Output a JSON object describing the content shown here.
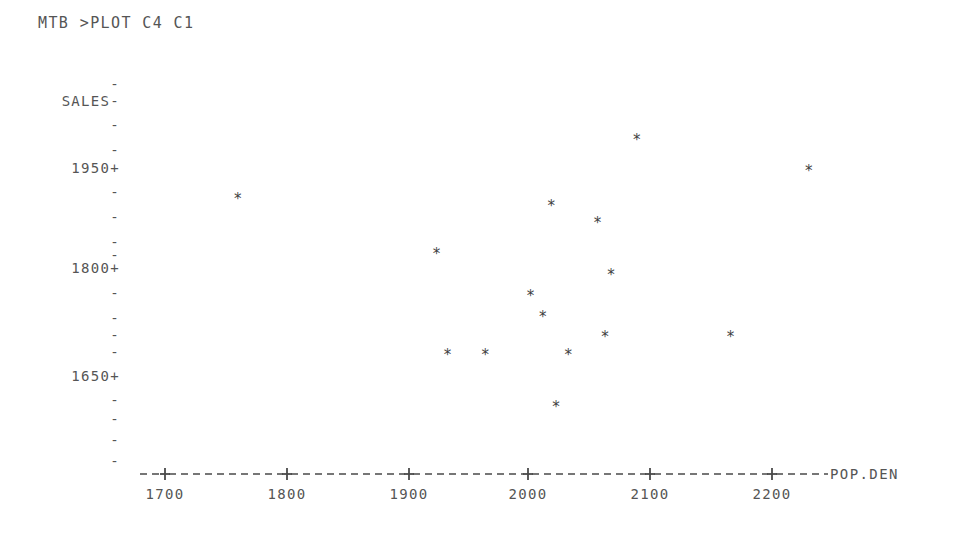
{
  "terminal": {
    "command_line": "MTB >PLOT C4 C1"
  },
  "plot": {
    "y_axis_title": "SALES",
    "x_axis_title": "POP.DEN",
    "point_glyph": "*",
    "tick_glyph_minor": "-",
    "tick_glyph_major": "+",
    "axis_dash_glyph": "-",
    "ink_color": "#4a4a4a",
    "background_color": "#ffffff"
  },
  "chart_data": {
    "type": "scatter",
    "title": "MTB >PLOT C4 C1",
    "xlabel": "POP.DEN",
    "ylabel": "SALES",
    "xlim": [
      1660,
      2260
    ],
    "ylim": [
      1575,
      2025
    ],
    "grid": false,
    "legend": null,
    "x_ticks": [
      1700,
      1800,
      1900,
      2000,
      2100,
      2200
    ],
    "y_ticks": [
      1950,
      1800,
      1650
    ],
    "y_minor_tick_count": 16,
    "y_tick_step": 25,
    "points": [
      {
        "x": 1760,
        "y": 1900
      },
      {
        "x": 2087,
        "y": 1985
      },
      {
        "x": 2228,
        "y": 1940
      },
      {
        "x": 2017,
        "y": 1890
      },
      {
        "x": 2055,
        "y": 1865
      },
      {
        "x": 1923,
        "y": 1820
      },
      {
        "x": 2066,
        "y": 1790
      },
      {
        "x": 2000,
        "y": 1760
      },
      {
        "x": 2010,
        "y": 1730
      },
      {
        "x": 2061,
        "y": 1700
      },
      {
        "x": 2164,
        "y": 1700
      },
      {
        "x": 1932,
        "y": 1675
      },
      {
        "x": 1963,
        "y": 1675
      },
      {
        "x": 2031,
        "y": 1675
      },
      {
        "x": 2021,
        "y": 1600
      }
    ],
    "series": [
      {
        "name": "SALES vs POP.DEN",
        "x": [
          1760,
          2087,
          2228,
          2017,
          2055,
          1923,
          2066,
          2000,
          2010,
          2061,
          2164,
          1932,
          1963,
          2031,
          2021
        ],
        "y": [
          1900,
          1985,
          1940,
          1890,
          1865,
          1820,
          1790,
          1760,
          1730,
          1700,
          1700,
          1675,
          1675,
          1675,
          1600
        ]
      }
    ]
  },
  "y_axis_rows": [
    {
      "label": "",
      "tick": "-",
      "top": 76
    },
    {
      "label": "SALES",
      "tick": "-",
      "top": 93
    },
    {
      "label": "",
      "tick": "-",
      "top": 117
    },
    {
      "label": "",
      "tick": "-",
      "top": 142
    },
    {
      "label": "1950",
      "tick": "+",
      "top": 160
    },
    {
      "label": "",
      "tick": "-",
      "top": 184
    },
    {
      "label": "",
      "tick": "-",
      "top": 209
    },
    {
      "label": "",
      "tick": "-",
      "top": 234
    },
    {
      "label": "",
      "tick": "-",
      "top": 247
    },
    {
      "label": "1800",
      "tick": "+",
      "top": 260
    },
    {
      "label": "",
      "tick": "-",
      "top": 285
    },
    {
      "label": "",
      "tick": "-",
      "top": 310
    },
    {
      "label": "",
      "tick": "-",
      "top": 327
    },
    {
      "label": "",
      "tick": "-",
      "top": 344
    },
    {
      "label": "1650",
      "tick": "+",
      "top": 368
    },
    {
      "label": "",
      "tick": "-",
      "top": 392
    },
    {
      "label": "",
      "tick": "-",
      "top": 411
    },
    {
      "label": "",
      "tick": "-",
      "top": 432
    },
    {
      "label": "",
      "tick": "-",
      "top": 453
    }
  ],
  "x_axis_labels": [
    {
      "label": "1700",
      "x": 165
    },
    {
      "label": "1800",
      "x": 287
    },
    {
      "label": "1900",
      "x": 409
    },
    {
      "label": "2000",
      "x": 528
    },
    {
      "label": "2100",
      "x": 650
    },
    {
      "label": "2200",
      "x": 772
    }
  ]
}
